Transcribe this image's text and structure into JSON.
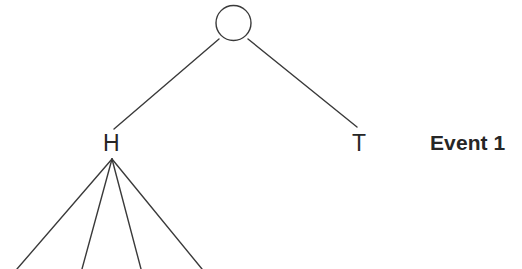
{
  "diagram": {
    "type": "probability-tree",
    "background_color": "#ffffff",
    "stroke_color": "#3a3a3a",
    "text_color": "#262626",
    "root": {
      "shape": "circle",
      "label": "",
      "cx": 233.5,
      "cy": 23,
      "r": 17.5,
      "stroke_width": 1.4
    },
    "branches": [
      {
        "name": "left-branch",
        "label": "H",
        "from_x": 219,
        "from_y": 39,
        "to_x": 114,
        "to_y": 129
      },
      {
        "name": "right-branch",
        "label": "T",
        "from_x": 248,
        "from_y": 39,
        "to_x": 357,
        "to_y": 127
      }
    ],
    "labels": [
      {
        "name": "h-node-label",
        "text": "H",
        "x": 103,
        "y": 132
      },
      {
        "name": "t-node-label",
        "text": "T",
        "x": 352,
        "y": 132
      }
    ],
    "fan": {
      "name": "h-child-fan",
      "apex_x": 112,
      "apex_y": 159,
      "line_count": 4,
      "endpoints": [
        {
          "x": 17,
          "y": 269
        },
        {
          "x": 82,
          "y": 269
        },
        {
          "x": 141,
          "y": 269
        },
        {
          "x": 202,
          "y": 269
        }
      ]
    },
    "annotation": {
      "name": "event-1-label",
      "text": "Event 1",
      "x": 430,
      "y": 132,
      "bold": true
    }
  }
}
